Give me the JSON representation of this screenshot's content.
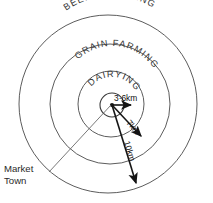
{
  "diagram": {
    "center_marker": "market-town-dot",
    "zones": [
      {
        "id": "inner",
        "label": "DAIRYING"
      },
      {
        "id": "middle",
        "label": "GRAIN FARMING"
      },
      {
        "id": "outer",
        "label": "BEEF FATTENING"
      }
    ],
    "radii": [
      {
        "id": "r1",
        "label": "3·6km"
      },
      {
        "id": "r2",
        "label": "7km"
      },
      {
        "id": "r3",
        "label": "10km"
      }
    ],
    "callout": {
      "line1": "Market",
      "line2": "Town"
    },
    "colors": {
      "ring_stroke": "#4a4a4a",
      "arrow_stroke": "#151515",
      "leader_stroke": "#6a6a6a",
      "text": "#2a2a2a",
      "background": "#ffffff"
    }
  }
}
